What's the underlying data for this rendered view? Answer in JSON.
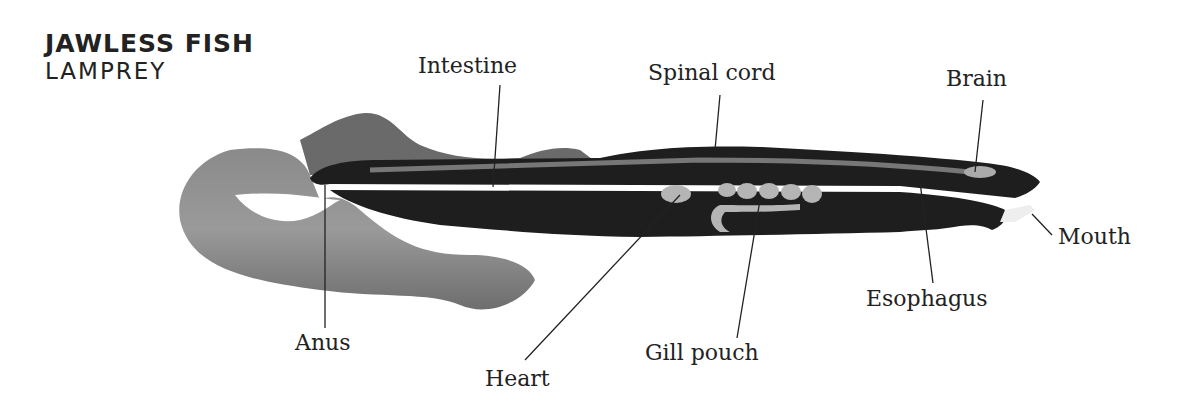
{
  "title": "JAWLESS FISH",
  "subtitle": "LAMPREY",
  "labels": {
    "intestine": "Intestine",
    "spinal_cord": "Spinal cord",
    "brain": "Brain",
    "mouth": "Mouth",
    "esophagus": "Esophagus",
    "gill_pouch": "Gill pouch",
    "heart": "Heart",
    "anus": "Anus"
  },
  "colors": {
    "body_dark": "#1e1e1e",
    "tail_gray": "#7a7a7a",
    "organ_light": "#b5b5b5",
    "text": "#222222"
  }
}
